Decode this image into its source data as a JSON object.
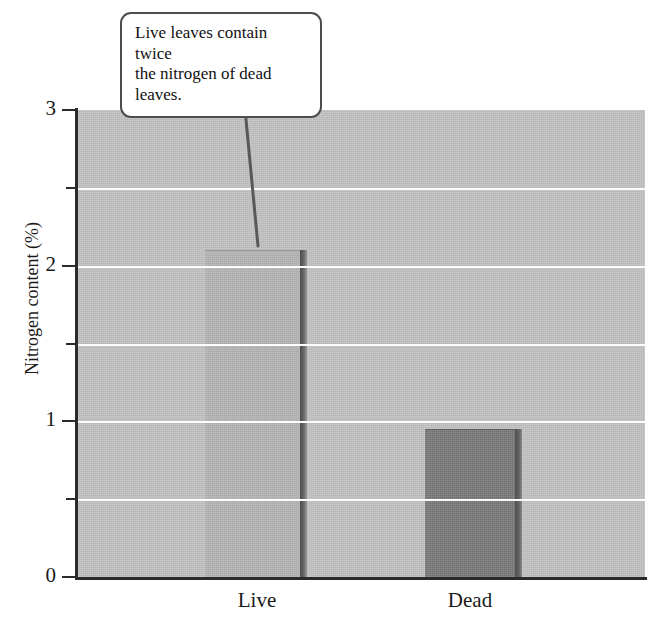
{
  "chart_data": {
    "type": "bar",
    "title": "",
    "xlabel": "",
    "ylabel": "Nitrogen content (%)",
    "categories": [
      "Live",
      "Dead"
    ],
    "values": [
      2.1,
      0.95
    ],
    "series": [
      {
        "name": "Nitrogen content",
        "values": [
          2.1,
          0.95
        ]
      }
    ],
    "ylim": [
      0,
      3
    ],
    "y_ticks_major": [
      "0",
      "1",
      "2",
      "3"
    ],
    "y_ticks_major_values": [
      0,
      1,
      2,
      3
    ],
    "y_ticks_minor_values": [
      0.5,
      1.5,
      2.5
    ],
    "grid": "horizontal-white-gridlines",
    "legend": "none",
    "annotations": [
      {
        "text": "Live leaves contain twice the nitrogen of dead leaves.",
        "points_to": "Live",
        "style": "rounded-callout-box-with-leader-line"
      }
    ],
    "colors": {
      "plot_background": "#c3c3c3",
      "bar_live": "#b6b6b6",
      "bar_dead": "#7c7c7c",
      "bar_side_shadow": "#5a5a5a",
      "gridline": "#fdfdfd",
      "axis": "#2b2b2b",
      "text": "#111111",
      "callout_border": "#4d4d4d",
      "callout_background": "#ffffff"
    }
  },
  "annotation": {
    "line1": "Live leaves contain twice",
    "line2": "the nitrogen of dead leaves."
  },
  "axis": {
    "y_title": "Nitrogen content (%)",
    "y_label_3": "3",
    "y_label_2": "2",
    "y_label_1": "1",
    "y_label_0": "0",
    "x_label_live": "Live",
    "x_label_dead": "Dead"
  }
}
